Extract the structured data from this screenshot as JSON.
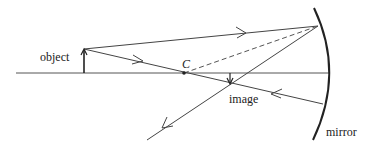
{
  "diagram": {
    "type": "concave-mirror-ray-diagram",
    "labels": {
      "object": "object",
      "center": "C",
      "image": "image",
      "mirror": "mirror"
    },
    "colors": {
      "line": "#333333",
      "text": "#222222",
      "background": "#ffffff"
    },
    "elements": [
      {
        "name": "principal-axis",
        "from": [
          16,
          73
        ],
        "to": [
          329,
          73
        ]
      },
      {
        "name": "object-arrow",
        "base": [
          84,
          73
        ],
        "tip": [
          84,
          49
        ]
      },
      {
        "name": "center-of-curvature",
        "at": [
          184,
          73
        ]
      },
      {
        "name": "image-arrow",
        "base": [
          230,
          73
        ],
        "tip": [
          230,
          83
        ]
      },
      {
        "name": "mirror-arc",
        "top": [
          314,
          8
        ],
        "vertex": [
          329,
          73
        ],
        "bottom": [
          313,
          140
        ]
      },
      {
        "name": "ray-1-incident",
        "from": [
          84,
          49
        ],
        "to": [
          318,
          26
        ]
      },
      {
        "name": "ray-1-reflected",
        "from": [
          318,
          26
        ],
        "to": [
          147,
          140
        ]
      },
      {
        "name": "ray-2-incident",
        "from": [
          84,
          49
        ],
        "to": [
          323,
          104
        ]
      },
      {
        "name": "ray-2-reflected",
        "from": [
          323,
          104
        ],
        "to": [
          184,
          73
        ]
      },
      {
        "name": "normal-dashed",
        "from": [
          184,
          73
        ],
        "to": [
          318,
          26
        ],
        "style": "dashed"
      }
    ]
  }
}
